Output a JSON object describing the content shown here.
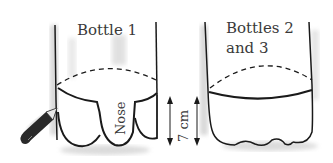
{
  "diagram": {
    "bottle1": {
      "label": "Bottle 1",
      "tab_label": "Nose"
    },
    "bottle23": {
      "label_line1": "Bottles 2",
      "label_line2": "and 3"
    },
    "dimension": {
      "label": "7 cm"
    },
    "icons": {
      "pencil": "pencil-icon"
    },
    "colors": {
      "line": "#1a1a1a",
      "shade": "#c8c8c8",
      "text": "#3a3a3a",
      "pencil": "#2a2a2a"
    }
  }
}
